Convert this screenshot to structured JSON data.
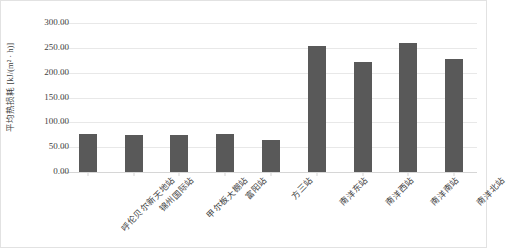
{
  "chart_data": {
    "type": "bar",
    "title": "",
    "subtitle": "",
    "xlabel": "",
    "ylabel": "平均热损耗 [kJ/(m² · h)]",
    "ylim": [
      0,
      300
    ],
    "ytick_step": 50,
    "ytick_labels": [
      "0.00",
      "50.00",
      "100.00",
      "150.00",
      "200.00",
      "250.00",
      "300.00"
    ],
    "ytick_values": [
      0,
      50,
      100,
      150,
      200,
      250,
      300
    ],
    "grid": true,
    "legend": "none",
    "bar_color": "#595959",
    "categories": [
      "呼伦贝尔新天地站",
      "锦州国际站",
      "甲尔板大棚站",
      "富阳站",
      "方三站",
      "南洋东站",
      "南洋西站",
      "南洋南站",
      "南洋北站"
    ],
    "values": [
      77,
      75,
      74,
      77,
      65,
      253,
      221,
      259,
      228
    ]
  },
  "axis": {
    "y_title": "平均热损耗 [kJ/(m² · h)]"
  }
}
